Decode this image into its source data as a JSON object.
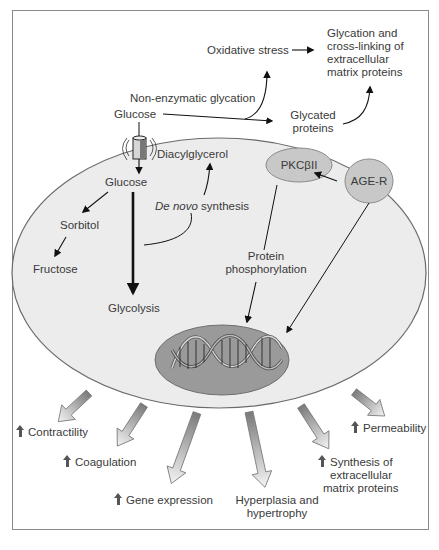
{
  "colors": {
    "cell_fill": "#ececec",
    "cell_stroke": "#6a6a6a",
    "nucleus_fill": "#9a9a9a",
    "node_fill": "#c8c8c8",
    "text": "#3a3a3a",
    "arrow": "#111111"
  },
  "outside": {
    "glucose": "Glucose",
    "non_enzymatic_glycation": "Non-enzymatic glycation",
    "oxidative_stress": "Oxidative stress",
    "glycated_proteins_line1": "Glycated",
    "glycated_proteins_line2": "proteins",
    "ecm_glycation_line1": "Glycation and",
    "ecm_glycation_line2": "cross-linking of",
    "ecm_glycation_line3": "extracellular",
    "ecm_glycation_line4": "matrix proteins"
  },
  "cell": {
    "transporter_icon": "glucose-transporter-icon",
    "glucose": "Glucose",
    "diacylglycerol": "Diacylglycerol",
    "de_novo_italic": "De novo",
    "de_novo_rest": " synthesis",
    "sorbitol": "Sorbitol",
    "fructose": "Fructose",
    "glycolysis": "Glycolysis",
    "pkc": "PKCβII",
    "age_r": "AGE-R",
    "protein_phos_line1": "Protein",
    "protein_phos_line2": "phosphorylation",
    "nucleus_icon": "dna-helix-icon"
  },
  "outcomes": [
    {
      "label": "Contractility",
      "increase": true
    },
    {
      "label": "Coagulation",
      "increase": true
    },
    {
      "label": "Gene expression",
      "increase": true
    },
    {
      "label_line1": "Hyperplasia and",
      "label_line2": "hypertrophy",
      "increase": false
    },
    {
      "label_line1": "Synthesis of",
      "label_line2": "extracellular",
      "label_line3": "matrix proteins",
      "increase": true
    },
    {
      "label": "Permeability",
      "increase": true
    }
  ]
}
